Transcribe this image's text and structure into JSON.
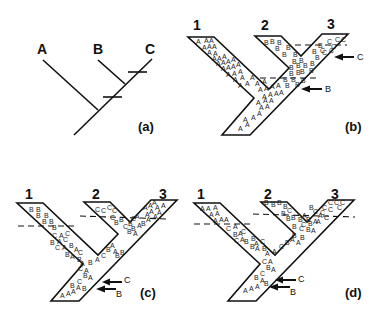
{
  "figure": {
    "panels": [
      {
        "id": "a",
        "label": "(a)"
      },
      {
        "id": "b",
        "label": "(b)"
      },
      {
        "id": "c",
        "label": "(c)"
      },
      {
        "id": "d",
        "label": "(d)"
      }
    ]
  },
  "panel_a": {
    "tips": [
      "A",
      "B",
      "C"
    ],
    "label": "(a)"
  },
  "panel_b": {
    "branch_labels": [
      "1",
      "2",
      "3"
    ],
    "label": "(b)",
    "arrows": [
      {
        "label": "C"
      },
      {
        "label": "B"
      }
    ],
    "letters": [
      [
        196,
        44,
        "A"
      ],
      [
        204,
        43,
        "A"
      ],
      [
        209,
        43,
        "A"
      ],
      [
        202,
        50,
        "A"
      ],
      [
        207,
        49,
        "A"
      ],
      [
        212,
        49,
        "A"
      ],
      [
        207,
        55,
        "A"
      ],
      [
        213,
        56,
        "A"
      ],
      [
        212,
        61,
        "A"
      ],
      [
        217,
        61,
        "A"
      ],
      [
        222,
        59,
        "A"
      ],
      [
        216,
        66,
        "A"
      ],
      [
        221,
        65,
        "A"
      ],
      [
        226,
        64,
        "A"
      ],
      [
        231,
        62,
        "A"
      ],
      [
        221,
        71,
        "A"
      ],
      [
        226,
        70,
        "A"
      ],
      [
        231,
        69,
        "A"
      ],
      [
        236,
        67,
        "A"
      ],
      [
        226,
        77,
        "A"
      ],
      [
        232,
        76,
        "A"
      ],
      [
        238,
        74,
        "A"
      ],
      [
        233,
        82,
        "A"
      ],
      [
        240,
        80,
        "A"
      ],
      [
        250,
        80,
        "A"
      ],
      [
        238,
        88,
        "A"
      ],
      [
        245,
        86,
        "A"
      ],
      [
        255,
        86,
        "A"
      ],
      [
        262,
        84,
        "A"
      ],
      [
        258,
        92,
        "A"
      ],
      [
        264,
        91,
        "A"
      ],
      [
        270,
        89,
        "A"
      ],
      [
        276,
        88,
        "A"
      ],
      [
        262,
        99,
        "A"
      ],
      [
        268,
        97,
        "A"
      ],
      [
        274,
        96,
        "A"
      ],
      [
        279,
        95,
        "A"
      ],
      [
        256,
        105,
        "A"
      ],
      [
        263,
        103,
        "A"
      ],
      [
        269,
        103,
        "A"
      ],
      [
        259,
        110,
        "A"
      ],
      [
        265,
        109,
        "A"
      ],
      [
        257,
        116,
        "A"
      ],
      [
        243,
        122,
        "A"
      ],
      [
        251,
        120,
        "A"
      ],
      [
        245,
        127,
        "A"
      ],
      [
        238,
        131,
        "A"
      ],
      [
        264,
        45,
        "B"
      ],
      [
        270,
        44,
        "B"
      ],
      [
        277,
        45,
        "B"
      ],
      [
        275,
        51,
        "B"
      ],
      [
        286,
        50,
        "B"
      ],
      [
        282,
        57,
        "B"
      ],
      [
        293,
        57,
        "B"
      ],
      [
        299,
        63,
        "B"
      ],
      [
        292,
        64,
        "B"
      ],
      [
        289,
        70,
        "B"
      ],
      [
        296,
        68,
        "B"
      ],
      [
        303,
        68,
        "B"
      ],
      [
        310,
        66,
        "B"
      ],
      [
        315,
        60,
        "B"
      ],
      [
        312,
        54,
        "B"
      ],
      [
        300,
        74,
        "B"
      ],
      [
        309,
        73,
        "B"
      ],
      [
        289,
        76,
        "B"
      ],
      [
        296,
        75,
        "B"
      ],
      [
        283,
        82,
        "B"
      ],
      [
        291,
        82,
        "B"
      ],
      [
        285,
        88,
        "B"
      ],
      [
        295,
        87,
        "B"
      ],
      [
        301,
        83,
        "B"
      ],
      [
        322,
        55,
        "C"
      ],
      [
        327,
        44,
        "C"
      ],
      [
        335,
        42,
        "C"
      ],
      [
        341,
        42,
        "C"
      ],
      [
        331,
        49,
        "C"
      ],
      [
        318,
        48,
        "B"
      ],
      [
        320,
        53,
        "C"
      ],
      [
        329,
        53,
        "C"
      ]
    ]
  },
  "panel_c": {
    "branch_labels": [
      "1",
      "2",
      "3"
    ],
    "label": "(c)",
    "arrows": [
      {
        "label": "C"
      },
      {
        "label": "B"
      }
    ],
    "letters": [
      [
        29,
        212,
        "B"
      ],
      [
        36,
        212,
        "B"
      ],
      [
        36,
        218,
        "B"
      ],
      [
        44,
        218,
        "B"
      ],
      [
        42,
        224,
        "B"
      ],
      [
        49,
        224,
        "B"
      ],
      [
        52,
        230,
        "B"
      ],
      [
        52,
        238,
        "C"
      ],
      [
        59,
        238,
        "A"
      ],
      [
        65,
        236,
        "C"
      ],
      [
        50,
        245,
        "B"
      ],
      [
        57,
        244,
        "A"
      ],
      [
        63,
        242,
        "C"
      ],
      [
        55,
        250,
        "C"
      ],
      [
        62,
        250,
        "A"
      ],
      [
        69,
        248,
        "B"
      ],
      [
        74,
        252,
        "A"
      ],
      [
        78,
        255,
        "C"
      ],
      [
        65,
        257,
        "B"
      ],
      [
        70,
        259,
        "A"
      ],
      [
        77,
        262,
        "B"
      ],
      [
        80,
        266,
        "A"
      ],
      [
        88,
        265,
        "B"
      ],
      [
        95,
        262,
        "A"
      ],
      [
        101,
        258,
        "C"
      ],
      [
        106,
        252,
        "B"
      ],
      [
        110,
        248,
        "A"
      ],
      [
        113,
        254,
        "A"
      ],
      [
        115,
        258,
        "B"
      ],
      [
        120,
        255,
        "B"
      ],
      [
        78,
        271,
        "C"
      ],
      [
        84,
        273,
        "A"
      ],
      [
        83,
        278,
        "B"
      ],
      [
        88,
        280,
        "A"
      ],
      [
        77,
        284,
        "C"
      ],
      [
        70,
        288,
        "B"
      ],
      [
        76,
        290,
        "A"
      ],
      [
        82,
        291,
        "B"
      ],
      [
        60,
        298,
        "A"
      ],
      [
        66,
        296,
        "A"
      ],
      [
        71,
        294,
        "A"
      ],
      [
        95,
        212,
        "C"
      ],
      [
        101,
        213,
        "C"
      ],
      [
        107,
        210,
        "C"
      ],
      [
        112,
        213,
        "C"
      ],
      [
        110,
        220,
        "C"
      ],
      [
        114,
        225,
        "B"
      ],
      [
        119,
        222,
        "B"
      ],
      [
        123,
        229,
        "C"
      ],
      [
        128,
        226,
        "B"
      ],
      [
        131,
        221,
        "C"
      ],
      [
        135,
        219,
        "A"
      ],
      [
        131,
        231,
        "B"
      ],
      [
        137,
        228,
        "A"
      ],
      [
        141,
        226,
        "B"
      ],
      [
        146,
        222,
        "A"
      ],
      [
        127,
        234,
        "B"
      ],
      [
        133,
        236,
        "A"
      ],
      [
        143,
        210,
        "A"
      ],
      [
        148,
        208,
        "A"
      ],
      [
        152,
        205,
        "A"
      ],
      [
        155,
        210,
        "A"
      ],
      [
        157,
        215,
        "A"
      ],
      [
        149,
        214,
        "A"
      ],
      [
        153,
        219,
        "A"
      ],
      [
        145,
        217,
        "A"
      ],
      [
        161,
        208,
        "A"
      ]
    ]
  },
  "panel_d": {
    "branch_labels": [
      "1",
      "2",
      "3"
    ],
    "label": "(d)",
    "arrows": [
      {
        "label": "C"
      },
      {
        "label": "B"
      }
    ],
    "letters": [
      [
        200,
        211,
        "A"
      ],
      [
        206,
        211,
        "A"
      ],
      [
        213,
        210,
        "A"
      ],
      [
        209,
        217,
        "A"
      ],
      [
        215,
        216,
        "A"
      ],
      [
        213,
        223,
        "A"
      ],
      [
        219,
        222,
        "A"
      ],
      [
        224,
        222,
        "A"
      ],
      [
        226,
        231,
        "C"
      ],
      [
        233,
        229,
        "A"
      ],
      [
        233,
        237,
        "B"
      ],
      [
        238,
        236,
        "A"
      ],
      [
        241,
        234,
        "C"
      ],
      [
        234,
        243,
        "C"
      ],
      [
        240,
        242,
        "A"
      ],
      [
        244,
        244,
        "B"
      ],
      [
        251,
        241,
        "B"
      ],
      [
        254,
        246,
        "A"
      ],
      [
        260,
        244,
        "C"
      ],
      [
        250,
        249,
        "B"
      ],
      [
        255,
        251,
        "A"
      ],
      [
        262,
        251,
        "B"
      ],
      [
        265,
        256,
        "A"
      ],
      [
        272,
        254,
        "A"
      ],
      [
        279,
        249,
        "C"
      ],
      [
        285,
        245,
        "B"
      ],
      [
        290,
        242,
        "A"
      ],
      [
        292,
        238,
        "B"
      ],
      [
        296,
        245,
        "A"
      ],
      [
        300,
        240,
        "B"
      ],
      [
        262,
        264,
        "C"
      ],
      [
        268,
        264,
        "A"
      ],
      [
        266,
        270,
        "B"
      ],
      [
        271,
        272,
        "A"
      ],
      [
        260,
        276,
        "C"
      ],
      [
        254,
        280,
        "B"
      ],
      [
        260,
        283,
        "A"
      ],
      [
        264,
        286,
        "B"
      ],
      [
        243,
        293,
        "A"
      ],
      [
        249,
        291,
        "A"
      ],
      [
        255,
        289,
        "A"
      ],
      [
        264,
        205,
        "B"
      ],
      [
        271,
        207,
        "B"
      ],
      [
        277,
        205,
        "B"
      ],
      [
        283,
        209,
        "B"
      ],
      [
        281,
        216,
        "B"
      ],
      [
        287,
        213,
        "C"
      ],
      [
        286,
        221,
        "B"
      ],
      [
        291,
        220,
        "B"
      ],
      [
        298,
        222,
        "B"
      ],
      [
        302,
        218,
        "A"
      ],
      [
        306,
        222,
        "B"
      ],
      [
        301,
        227,
        "C"
      ],
      [
        308,
        226,
        "B"
      ],
      [
        313,
        224,
        "A"
      ],
      [
        318,
        218,
        "A"
      ],
      [
        313,
        214,
        "C"
      ],
      [
        309,
        210,
        "B"
      ],
      [
        292,
        229,
        "B"
      ],
      [
        299,
        231,
        "C"
      ],
      [
        306,
        232,
        "B"
      ],
      [
        311,
        233,
        "A"
      ],
      [
        322,
        210,
        "C"
      ],
      [
        328,
        205,
        "C"
      ],
      [
        334,
        205,
        "C"
      ],
      [
        340,
        205,
        "C"
      ],
      [
        320,
        215,
        "C"
      ],
      [
        328,
        212,
        "C"
      ],
      [
        337,
        210,
        "C"
      ],
      [
        324,
        220,
        "C"
      ],
      [
        316,
        224,
        "A"
      ]
    ]
  }
}
